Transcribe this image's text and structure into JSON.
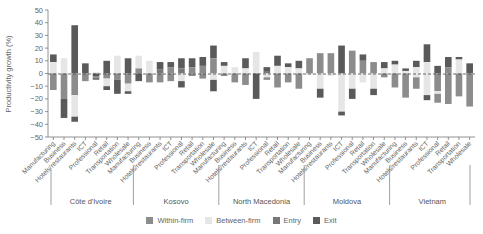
{
  "chart_data": {
    "type": "bar",
    "stacked": true,
    "title": "",
    "ylabel": "Productivity growth (%)",
    "xlabel": "",
    "ylim": [
      -50,
      50
    ],
    "yticks": [
      50,
      40,
      30,
      20,
      10,
      0,
      -10,
      -20,
      -30,
      -40,
      -50
    ],
    "zero_line": "dashed",
    "grid": false,
    "legend_position": "bottom",
    "colors": {
      "Within-firm": "#8c8c8c",
      "Between-firm": "#e6e6e6",
      "Entry": "#777777",
      "Exit": "#5a5a5a"
    },
    "groups": [
      "Côte d'Ivoire",
      "Kosovo",
      "North Macedonia",
      "Moldova",
      "Vietnam"
    ],
    "sectors": [
      "Manufacturing",
      "Business",
      "Hotels/restaurants",
      "ICT",
      "Professional",
      "Retail",
      "Transportation",
      "Wholesale"
    ],
    "series": [
      {
        "name": "Within-firm",
        "values": [
          -13,
          -20,
          -17,
          -6,
          -3,
          -4,
          -5,
          -8,
          4,
          -7,
          -7,
          -9,
          -7,
          -4,
          4,
          12,
          -2,
          -7,
          -9,
          -3,
          -9,
          -7,
          -12,
          5,
          12,
          16,
          16,
          12,
          14,
          6,
          8,
          3,
          -11,
          -19,
          -9,
          -17,
          -23,
          -24,
          -18,
          -26
        ]
      },
      {
        "name": "Between-firm",
        "values": [
          9,
          12,
          -17,
          0,
          1,
          -10,
          14,
          -8,
          6,
          10,
          -2,
          3,
          -6,
          5,
          2,
          -14,
          2,
          5,
          4,
          17,
          2,
          6,
          3,
          4,
          -18,
          -15,
          -30,
          -19,
          -21,
          -7,
          -12,
          3,
          3,
          2,
          -3,
          5,
          -17,
          -1,
          -4,
          1
        ]
      },
      {
        "name": "Entry",
        "values": [
          0,
          0,
          0,
          0,
          -2,
          -1,
          0,
          -6,
          -2,
          0,
          3,
          5,
          4,
          0,
          0,
          0,
          0,
          0,
          0,
          0,
          2,
          4,
          2,
          0,
          0,
          0,
          0,
          0,
          0,
          3,
          3,
          0,
          0,
          0,
          -1,
          0,
          0,
          0,
          0,
          0
        ]
      },
      {
        "name": "Exit",
        "values": [
          6,
          -15,
          38,
          8,
          -2,
          10,
          -11,
          12,
          4,
          -2,
          5,
          5,
          -4,
          6,
          6,
          -5,
          2,
          0,
          8,
          -20,
          3,
          6,
          3,
          10,
          4,
          -7,
          23,
          -7,
          0,
          7,
          -5,
          4,
          2,
          2,
          5,
          -4,
          5,
          5,
          1,
          8
        ]
      }
    ],
    "bars": [
      {
        "group": "Côte d'Ivoire",
        "sector": "Manufacturing",
        "segments": [
          [
            9,
            15,
            "Exit"
          ],
          [
            0,
            9,
            "Between-firm"
          ],
          [
            -13,
            0,
            "Within-firm"
          ]
        ]
      },
      {
        "group": "Côte d'Ivoire",
        "sector": "Business",
        "segments": [
          [
            0,
            12,
            "Between-firm"
          ],
          [
            -20,
            0,
            "Within-firm"
          ],
          [
            -35,
            -20,
            "Exit"
          ]
        ]
      },
      {
        "group": "Côte d'Ivoire",
        "sector": "Hotels/restaurants",
        "segments": [
          [
            0,
            38,
            "Exit"
          ],
          [
            -17,
            0,
            "Within-firm"
          ],
          [
            -34,
            -17,
            "Between-firm"
          ],
          [
            -38,
            -34,
            "Exit"
          ]
        ]
      },
      {
        "group": "Côte d'Ivoire",
        "sector": "ICT",
        "segments": [
          [
            0,
            8,
            "Exit"
          ],
          [
            -6,
            0,
            "Within-firm"
          ]
        ]
      },
      {
        "group": "Côte d'Ivoire",
        "sector": "Professional",
        "segments": [
          [
            0,
            1,
            "Between-firm"
          ],
          [
            -2,
            0,
            "Exit"
          ],
          [
            -3,
            -2,
            "Within-firm"
          ],
          [
            -5,
            -3,
            "Entry"
          ]
        ]
      },
      {
        "group": "Côte d'Ivoire",
        "sector": "Retail",
        "segments": [
          [
            0,
            10,
            "Exit"
          ],
          [
            -4,
            0,
            "Within-firm"
          ],
          [
            -10,
            -4,
            "Between-firm"
          ],
          [
            -13,
            -10,
            "Exit"
          ]
        ]
      },
      {
        "group": "Côte d'Ivoire",
        "sector": "Transportation",
        "segments": [
          [
            0,
            14,
            "Between-firm"
          ],
          [
            -5,
            0,
            "Within-firm"
          ],
          [
            -16,
            -5,
            "Exit"
          ]
        ]
      },
      {
        "group": "Côte d'Ivoire",
        "sector": "Wholesale",
        "segments": [
          [
            0,
            12,
            "Exit"
          ],
          [
            -8,
            0,
            "Within-firm"
          ],
          [
            -14,
            -8,
            "Between-firm"
          ],
          [
            -16,
            -14,
            "Exit"
          ]
        ]
      },
      {
        "group": "Kosovo",
        "sector": "Manufacturing",
        "segments": [
          [
            4,
            14,
            "Between-firm"
          ],
          [
            0,
            4,
            "Within-firm"
          ],
          [
            -6,
            0,
            "Exit"
          ]
        ]
      },
      {
        "group": "Kosovo",
        "sector": "Business",
        "segments": [
          [
            0,
            10,
            "Between-firm"
          ],
          [
            -7,
            0,
            "Within-firm"
          ]
        ]
      },
      {
        "group": "Kosovo",
        "sector": "Hotels/restaurants",
        "segments": [
          [
            3,
            9,
            "Exit"
          ],
          [
            0,
            3,
            "Entry"
          ],
          [
            -7,
            0,
            "Within-firm"
          ]
        ]
      },
      {
        "group": "Kosovo",
        "sector": "ICT",
        "segments": [
          [
            5,
            9,
            "Exit"
          ],
          [
            0,
            5,
            "Within-firm"
          ],
          [
            -6,
            0,
            "Within-firm"
          ]
        ]
      },
      {
        "group": "Kosovo",
        "sector": "Professional",
        "segments": [
          [
            4,
            12,
            "Exit"
          ],
          [
            0,
            4,
            "Entry"
          ],
          [
            -6,
            0,
            "Between-firm"
          ],
          [
            -11,
            -6,
            "Exit"
          ]
        ]
      },
      {
        "group": "Kosovo",
        "sector": "Retail",
        "segments": [
          [
            5,
            12,
            "Exit"
          ],
          [
            0,
            5,
            "Within-firm"
          ],
          [
            -2,
            0,
            "Within-firm"
          ]
        ]
      },
      {
        "group": "Kosovo",
        "sector": "Transportation",
        "segments": [
          [
            6,
            13,
            "Exit"
          ],
          [
            0,
            6,
            "Within-firm"
          ],
          [
            -4,
            0,
            "Within-firm"
          ]
        ]
      },
      {
        "group": "Kosovo",
        "sector": "Wholesale",
        "segments": [
          [
            12,
            22,
            "Exit"
          ],
          [
            0,
            12,
            "Within-firm"
          ],
          [
            -5,
            0,
            "Between-firm"
          ],
          [
            -14,
            -5,
            "Exit"
          ]
        ]
      },
      {
        "group": "North Macedonia",
        "sector": "Manufacturing",
        "segments": [
          [
            6,
            9,
            "Exit"
          ],
          [
            0,
            6,
            "Between-firm"
          ],
          [
            -2,
            0,
            "Within-firm"
          ]
        ]
      },
      {
        "group": "North Macedonia",
        "sector": "Business",
        "segments": [
          [
            0,
            5,
            "Between-firm"
          ],
          [
            -7,
            0,
            "Within-firm"
          ]
        ]
      },
      {
        "group": "North Macedonia",
        "sector": "Hotels/restaurants",
        "segments": [
          [
            4,
            12,
            "Exit"
          ],
          [
            0,
            4,
            "Between-firm"
          ],
          [
            -9,
            0,
            "Within-firm"
          ]
        ]
      },
      {
        "group": "North Macedonia",
        "sector": "ICT",
        "segments": [
          [
            0,
            17,
            "Between-firm"
          ],
          [
            -20,
            0,
            "Exit"
          ]
        ]
      },
      {
        "group": "North Macedonia",
        "sector": "Professional",
        "segments": [
          [
            2,
            5,
            "Exit"
          ],
          [
            0,
            2,
            "Entry"
          ],
          [
            -3,
            0,
            "Between-firm"
          ],
          [
            -5,
            -3,
            "Within-firm"
          ]
        ]
      },
      {
        "group": "North Macedonia",
        "sector": "Retail",
        "segments": [
          [
            6,
            14,
            "Exit"
          ],
          [
            0,
            6,
            "Between-firm"
          ],
          [
            -11,
            0,
            "Within-firm"
          ]
        ]
      },
      {
        "group": "North Macedonia",
        "sector": "Transportation",
        "segments": [
          [
            5,
            8,
            "Exit"
          ],
          [
            0,
            5,
            "Between-firm"
          ],
          [
            -7,
            0,
            "Within-firm"
          ]
        ]
      },
      {
        "group": "North Macedonia",
        "sector": "Wholesale",
        "segments": [
          [
            4,
            10,
            "Exit"
          ],
          [
            0,
            4,
            "Between-firm"
          ],
          [
            -12,
            0,
            "Within-firm"
          ]
        ]
      },
      {
        "group": "Moldova",
        "sector": "Manufacturing",
        "segments": [
          [
            0,
            12,
            "Within-firm"
          ],
          [
            -1,
            0,
            "Between-firm"
          ]
        ]
      },
      {
        "group": "Moldova",
        "sector": "Business",
        "segments": [
          [
            0,
            16,
            "Within-firm"
          ],
          [
            -12,
            0,
            "Between-firm"
          ],
          [
            -19,
            -12,
            "Exit"
          ]
        ]
      },
      {
        "group": "Moldova",
        "sector": "Hotels/restaurants",
        "segments": [
          [
            0,
            16,
            "Within-firm"
          ],
          [
            -2,
            0,
            "Between-firm"
          ]
        ]
      },
      {
        "group": "Moldova",
        "sector": "ICT",
        "segments": [
          [
            0,
            22,
            "Exit"
          ],
          [
            -30,
            0,
            "Between-firm"
          ],
          [
            -33,
            -30,
            "Exit"
          ]
        ]
      },
      {
        "group": "Moldova",
        "sector": "Professional",
        "segments": [
          [
            0,
            18,
            "Within-firm"
          ],
          [
            -12,
            0,
            "Between-firm"
          ],
          [
            -20,
            -12,
            "Exit"
          ]
        ]
      },
      {
        "group": "Moldova",
        "sector": "Retail",
        "segments": [
          [
            10,
            15,
            "Exit"
          ],
          [
            0,
            10,
            "Within-firm"
          ],
          [
            -7,
            0,
            "Between-firm"
          ]
        ]
      },
      {
        "group": "Moldova",
        "sector": "Transportation",
        "segments": [
          [
            0,
            9,
            "Within-firm"
          ],
          [
            -12,
            0,
            "Between-firm"
          ],
          [
            -17,
            -12,
            "Exit"
          ]
        ]
      },
      {
        "group": "Moldova",
        "sector": "Wholesale",
        "segments": [
          [
            4,
            9,
            "Exit"
          ],
          [
            0,
            4,
            "Between-firm"
          ],
          [
            -3,
            0,
            "Within-firm"
          ]
        ]
      },
      {
        "group": "Vietnam",
        "sector": "Manufacturing",
        "segments": [
          [
            7,
            10,
            "Exit"
          ],
          [
            0,
            7,
            "Between-firm"
          ],
          [
            -11,
            0,
            "Within-firm"
          ]
        ]
      },
      {
        "group": "Vietnam",
        "sector": "Business",
        "segments": [
          [
            2,
            4,
            "Exit"
          ],
          [
            0,
            2,
            "Between-firm"
          ],
          [
            -19,
            0,
            "Within-firm"
          ]
        ]
      },
      {
        "group": "Vietnam",
        "sector": "Hotels/restaurants",
        "segments": [
          [
            5,
            10,
            "Exit"
          ],
          [
            0,
            5,
            "Between-firm"
          ],
          [
            -3,
            0,
            "Between-firm"
          ],
          [
            -12,
            -3,
            "Within-firm"
          ]
        ]
      },
      {
        "group": "Vietnam",
        "sector": "ICT",
        "segments": [
          [
            9,
            23,
            "Exit"
          ],
          [
            0,
            9,
            "Between-firm"
          ],
          [
            -17,
            0,
            "Between-firm"
          ],
          [
            -21,
            -17,
            "Exit"
          ]
        ]
      },
      {
        "group": "Vietnam",
        "sector": "Professional",
        "segments": [
          [
            0,
            6,
            "Exit"
          ],
          [
            -14,
            0,
            "Within-firm"
          ],
          [
            -16,
            -14,
            "Between-firm"
          ],
          [
            -23,
            -16,
            "Within-firm"
          ]
        ]
      },
      {
        "group": "Vietnam",
        "sector": "Retail",
        "segments": [
          [
            5,
            13,
            "Exit"
          ],
          [
            0,
            5,
            "Within-firm"
          ],
          [
            -24,
            0,
            "Within-firm"
          ]
        ]
      },
      {
        "group": "Vietnam",
        "sector": "Transportation",
        "segments": [
          [
            11,
            13,
            "Exit"
          ],
          [
            0,
            11,
            "Between-firm"
          ],
          [
            -18,
            0,
            "Within-firm"
          ]
        ]
      },
      {
        "group": "Vietnam",
        "sector": "Wholesale",
        "segments": [
          [
            0,
            8,
            "Exit"
          ],
          [
            -26,
            0,
            "Within-firm"
          ]
        ]
      }
    ]
  },
  "legend": {
    "items": [
      {
        "label": "Within-firm",
        "color": "#8c8c8c"
      },
      {
        "label": "Between-firm",
        "color": "#e6e6e6"
      },
      {
        "label": "Entry",
        "color": "#777777"
      },
      {
        "label": "Exit",
        "color": "#5a5a5a"
      }
    ]
  },
  "axis": {
    "ylabel": "Productivity growth (%)"
  }
}
